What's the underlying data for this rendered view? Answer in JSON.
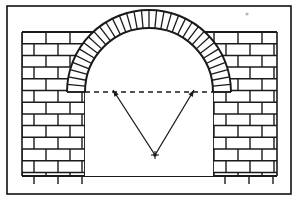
{
  "figure": {
    "caption": "",
    "background_color": "#ffffff",
    "line_color": "#1a1a1a",
    "brick_fill": "#ffffff",
    "mortar_color": "#1a1a1a",
    "speck_color": "#b9b9b9"
  },
  "frame": {
    "name": "outer-border",
    "x": 7,
    "y": 6,
    "width": 284,
    "height": 188,
    "stroke_width": 1.6,
    "stroke_color": "#111111"
  },
  "wall": {
    "name": "brick-wall-elevation",
    "left": 22,
    "right": 277,
    "top": 32,
    "bottom": 176,
    "course_height": 11.7,
    "course_count": 13,
    "bond": "running-bond",
    "brick_length": 24,
    "offset_alternate": 12,
    "baseline_ticks": {
      "count": 8,
      "length": 8,
      "note": "partial cut-off bottom course shown as vertical joint stubs"
    }
  },
  "opening": {
    "name": "arch-opening",
    "left_pier_inner_x": 85,
    "right_pier_inner_x": 213,
    "springing_y": 92,
    "sill_y": 176,
    "fill": "#ffffff"
  },
  "arch": {
    "name": "voussoir-ring",
    "center_x": 149,
    "center_y": 92,
    "intrados_radius": 64,
    "extrados_radius": 82,
    "span_degrees": 180,
    "voussoir_count": 34,
    "crown_y": 28,
    "description": "radial wedge-shaped bricks (voussoirs) forming the arch ring"
  },
  "construction_lines": {
    "name": "geometry-overlay",
    "radius_center": {
      "name": "radius-center-point",
      "x": 155,
      "y": 155,
      "marker": "cross-dot"
    },
    "springing_line": {
      "name": "springing-dashed-line",
      "x1": 85,
      "x2": 213,
      "y": 92,
      "style": "dashed",
      "dash_pattern": "5 4"
    },
    "radii": [
      {
        "name": "radius-line-left",
        "from_x": 155,
        "from_y": 155,
        "to_x": 113,
        "to_y": 90,
        "arrowhead": "at-upper-end"
      },
      {
        "name": "radius-line-right",
        "from_x": 155,
        "from_y": 155,
        "to_x": 194,
        "to_y": 90,
        "arrowhead": "at-upper-end"
      }
    ]
  },
  "artifacts": {
    "speck": {
      "name": "scan-speck",
      "x": 247,
      "y": 14,
      "r": 1.6
    }
  },
  "labels": {
    "items": []
  }
}
